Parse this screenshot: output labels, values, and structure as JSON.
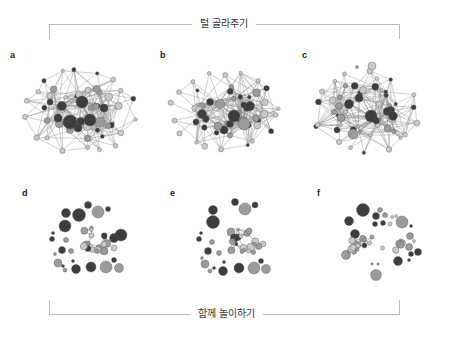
{
  "labels": {
    "top": "털 골라주기",
    "bottom": "함께 놀이하기"
  },
  "colors": {
    "dark": "#3d3d3d",
    "mid": "#9b9b9b",
    "light": "#c9c9c9",
    "edge": "#8a8a8a",
    "stroke": "#555555"
  },
  "panels": [
    {
      "id": "a",
      "letter": "a",
      "x": 10,
      "y": 50
    },
    {
      "id": "b",
      "letter": "b",
      "x": 160,
      "y": 50
    },
    {
      "id": "c",
      "letter": "c",
      "x": 302,
      "y": 50
    },
    {
      "id": "d",
      "letter": "d",
      "x": 22,
      "y": 188
    },
    {
      "id": "e",
      "letter": "e",
      "x": 170,
      "y": 188
    },
    {
      "id": "f",
      "letter": "f",
      "x": 317,
      "y": 188
    }
  ]
}
